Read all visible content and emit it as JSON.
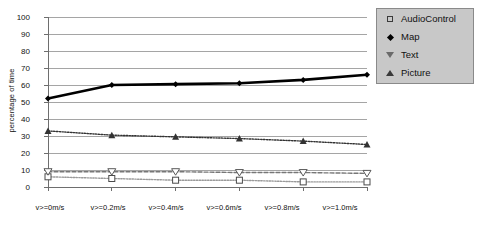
{
  "chart_data": {
    "type": "line",
    "title": "",
    "xlabel": "",
    "ylabel": "percentage of time",
    "ylim": [
      0,
      100
    ],
    "ytick_step": 10,
    "grid": true,
    "legend_position": "right",
    "categories": [
      "v>=0m/s",
      "v>=0.2m/s",
      "v>=0.4m/s",
      "v>=0.6m/s",
      "v>=0.8m/s",
      "v>=1.0m/s"
    ],
    "yticks": [
      "0",
      "10",
      "20",
      "30",
      "40",
      "50",
      "60",
      "70",
      "80",
      "90",
      "100"
    ],
    "series": [
      {
        "name": "AudioControl",
        "marker": "open-square",
        "color": "#9a9a9a",
        "line": "dotted",
        "values": [
          6,
          5,
          4,
          4,
          3,
          3
        ]
      },
      {
        "name": "Map",
        "marker": "filled-diamond",
        "color": "#000000",
        "line": "solid",
        "values": [
          52,
          60,
          60.5,
          61,
          63,
          66
        ]
      },
      {
        "name": "Text",
        "marker": "open-triangle-down",
        "color": "#777777",
        "line": "dashed",
        "values": [
          9,
          9,
          9,
          8.5,
          8.5,
          8
        ]
      },
      {
        "name": "Picture",
        "marker": "filled-triangle-up",
        "color": "#333333",
        "line": "dotted",
        "values": [
          33,
          30.5,
          29.5,
          28.5,
          27,
          25
        ]
      }
    ]
  },
  "axis": {
    "y_label_text": "percentage of time"
  },
  "legend": {
    "items": [
      {
        "label": "AudioControl",
        "icon": "open-square-marker-icon"
      },
      {
        "label": "Map",
        "icon": "filled-diamond-marker-icon"
      },
      {
        "label": "Text",
        "icon": "open-triangle-down-marker-icon"
      },
      {
        "label": "Picture",
        "icon": "filled-triangle-up-marker-icon"
      }
    ]
  },
  "colors": {
    "background": "#ffffff",
    "grid": "#7f7f7f",
    "axis": "#6e6e6e",
    "legend_bg": "#c8c8c8",
    "legend_border": "#8a8a8a",
    "text": "#111111"
  }
}
